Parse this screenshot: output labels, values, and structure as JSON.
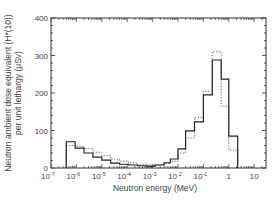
{
  "chart_data": {
    "type": "bar",
    "subtype": "step-histogram",
    "title": "",
    "xlabel": "Neutron energy (MeV)",
    "ylabel_line1": "Neutron ambient dose equivalent (H*(10))",
    "ylabel_line2": "per unit lethargy (μSv)",
    "xscale": "log",
    "xlim": [
      1e-07,
      31.6
    ],
    "ylim": [
      0,
      400
    ],
    "grid": false,
    "legend": null,
    "x_tick_labels": [
      {
        "exp": "-7",
        "base": "10",
        "value": 1e-07
      },
      {
        "exp": "-6",
        "base": "10",
        "value": 1e-06
      },
      {
        "exp": "-5",
        "base": "10",
        "value": 1e-05
      },
      {
        "exp": "-4",
        "base": "10",
        "value": 0.0001
      },
      {
        "exp": "-3",
        "base": "10",
        "value": 0.001
      },
      {
        "exp": "-2",
        "base": "10",
        "value": 0.01
      },
      {
        "exp": "-1",
        "base": "10",
        "value": 0.1
      },
      {
        "exp": "",
        "base": "1",
        "value": 1
      },
      {
        "exp": "",
        "base": "10",
        "value": 10
      }
    ],
    "y_tick_labels": [
      "0",
      "100",
      "200",
      "300",
      "400"
    ],
    "bin_edges_log10": [
      -6.4,
      -6.05,
      -5.7,
      -5.35,
      -5.0,
      -4.65,
      -4.3,
      -3.95,
      -3.6,
      -3.25,
      -2.9,
      -2.55,
      -2.3,
      -2.0,
      -1.7,
      -1.35,
      -1.0,
      -0.65,
      -0.3,
      0.0,
      0.35
    ],
    "series": [
      {
        "name": "solid",
        "style": "solid",
        "color": "#222222",
        "values": [
          70,
          53,
          40,
          29,
          21,
          13,
          10,
          8,
          6,
          5,
          8,
          14,
          24,
          51,
          99,
          123,
          195,
          288,
          237,
          85
        ]
      },
      {
        "name": "dotted",
        "style": "dotted",
        "color": "#555555",
        "values": [
          60,
          58,
          52,
          42,
          33,
          24,
          18,
          14,
          10,
          8,
          9,
          12,
          18,
          40,
          80,
          135,
          205,
          310,
          165,
          48
        ]
      }
    ]
  }
}
